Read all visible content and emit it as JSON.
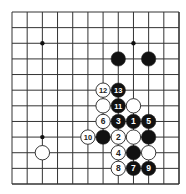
{
  "diagram": {
    "type": "go-board-diagram",
    "grid": {
      "columns": 12,
      "rows": 12,
      "x_start": 12,
      "x_end": 179,
      "y_start": 12,
      "y_end": 184,
      "line_color": "#333333"
    },
    "colors": {
      "black_stone": "#111111",
      "white_stone": "#ffffff",
      "stone_outline": "#222222",
      "number_on_black": "#ffffff",
      "number_on_white": "#222222"
    },
    "star_points": [
      {
        "col": 2,
        "row": 2
      },
      {
        "col": 8,
        "row": 2
      },
      {
        "col": 2,
        "row": 8
      }
    ],
    "stones": [
      {
        "color": "black",
        "col": 7,
        "row": 3,
        "label": ""
      },
      {
        "color": "black",
        "col": 9,
        "row": 3,
        "label": ""
      },
      {
        "color": "white",
        "col": 6,
        "row": 5,
        "label": "12"
      },
      {
        "color": "black",
        "col": 7,
        "row": 5,
        "label": "13"
      },
      {
        "color": "white",
        "col": 6,
        "row": 6,
        "label": ""
      },
      {
        "color": "black",
        "col": 7,
        "row": 6,
        "label": "11"
      },
      {
        "color": "white",
        "col": 8,
        "row": 6,
        "label": ""
      },
      {
        "color": "white",
        "col": 6,
        "row": 7,
        "label": "6"
      },
      {
        "color": "black",
        "col": 7,
        "row": 7,
        "label": "3"
      },
      {
        "color": "black",
        "col": 8,
        "row": 7,
        "label": "1"
      },
      {
        "color": "black",
        "col": 9,
        "row": 7,
        "label": "5"
      },
      {
        "color": "white",
        "col": 5,
        "row": 8,
        "label": "10"
      },
      {
        "color": "black",
        "col": 6,
        "row": 8,
        "label": ""
      },
      {
        "color": "white",
        "col": 7,
        "row": 8,
        "label": "2"
      },
      {
        "color": "white",
        "col": 8,
        "row": 8,
        "label": ""
      },
      {
        "color": "black",
        "col": 9,
        "row": 8,
        "label": ""
      },
      {
        "color": "white",
        "col": 2,
        "row": 9,
        "label": ""
      },
      {
        "color": "white",
        "col": 7,
        "row": 9,
        "label": "4"
      },
      {
        "color": "black",
        "col": 8,
        "row": 9,
        "label": ""
      },
      {
        "color": "white",
        "col": 9,
        "row": 9,
        "label": ""
      },
      {
        "color": "white",
        "col": 7,
        "row": 10,
        "label": "8"
      },
      {
        "color": "black",
        "col": 8,
        "row": 10,
        "label": "7"
      },
      {
        "color": "black",
        "col": 9,
        "row": 10,
        "label": "9"
      }
    ]
  }
}
